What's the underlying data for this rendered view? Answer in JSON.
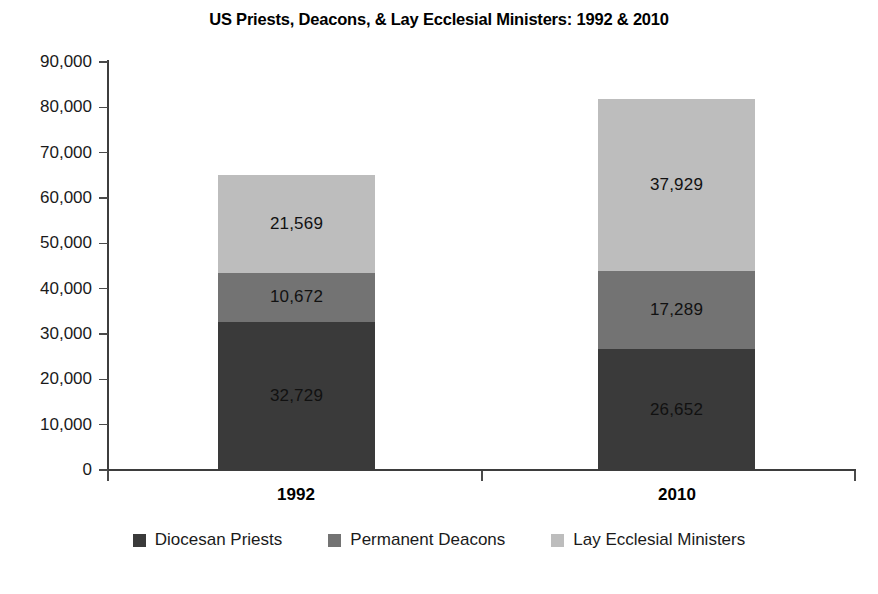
{
  "chart_data": {
    "type": "bar",
    "subtype": "stacked-column",
    "title": "US Priests, Deacons, & Lay Ecclesial Ministers: 1992 & 2010",
    "xlabel": "",
    "ylabel": "",
    "categories": [
      "1992",
      "2010"
    ],
    "ylim": [
      0,
      90000
    ],
    "ytick_step": 10000,
    "ytick_labels": [
      "0",
      "10,000",
      "20,000",
      "30,000",
      "40,000",
      "50,000",
      "60,000",
      "70,000",
      "80,000",
      "90,000"
    ],
    "ytick_values": [
      0,
      10000,
      20000,
      30000,
      40000,
      50000,
      60000,
      70000,
      80000,
      90000
    ],
    "grid": false,
    "legend_position": "bottom",
    "stack_order_bottom_to_top": [
      "Diocesan Priests",
      "Permanent Deacons",
      "Lay Ecclesial Ministers"
    ],
    "series": [
      {
        "name": "Diocesan Priests",
        "color": "#3a3a3a",
        "values": [
          32729,
          26652
        ],
        "labels": [
          "32,729",
          "26,652"
        ]
      },
      {
        "name": "Permanent Deacons",
        "color": "#737373",
        "values": [
          10672,
          17289
        ],
        "labels": [
          "10,672",
          "17,289"
        ]
      },
      {
        "name": "Lay Ecclesial Ministers",
        "color": "#bdbdbd",
        "values": [
          21569,
          37929
        ],
        "labels": [
          "21,569",
          "37,929"
        ]
      }
    ],
    "totals": [
      64970,
      81870
    ]
  },
  "axis": {
    "y_labels": [
      "90,000",
      "80,000",
      "70,000",
      "60,000",
      "50,000",
      "40,000",
      "30,000",
      "20,000",
      "10,000",
      "0"
    ],
    "x_labels": [
      "1992",
      "2010"
    ]
  },
  "bars": {
    "b1992": {
      "category": "1992",
      "light_label": "21,569",
      "medium_label": "10,672",
      "dark_label": "32,729"
    },
    "b2010": {
      "category": "2010",
      "light_label": "37,929",
      "medium_label": "17,289",
      "dark_label": "26,652"
    }
  },
  "legend": {
    "items": [
      {
        "label": "Diocesan Priests",
        "color": "#3a3a3a"
      },
      {
        "label": "Permanent Deacons",
        "color": "#737373"
      },
      {
        "label": "Lay Ecclesial Ministers",
        "color": "#bdbdbd"
      }
    ]
  }
}
